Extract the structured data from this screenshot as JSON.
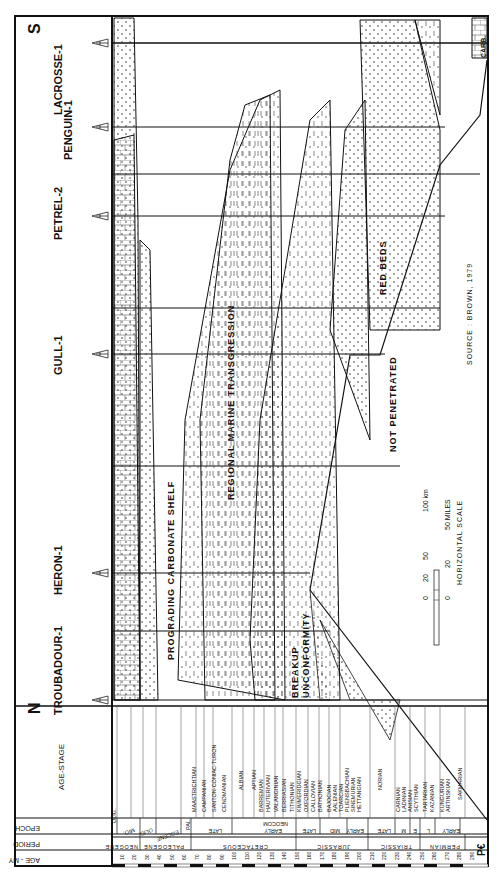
{
  "diagram": {
    "orientation": "rotated 90 degrees counter-clockwise",
    "direction_labels": {
      "north": "N",
      "south": "S"
    },
    "wells": [
      {
        "name": "TROUBADOUR-1",
        "x": 112
      },
      {
        "name": "HERON-1",
        "x": 174
      },
      {
        "name": "GULL-1",
        "x": 308
      },
      {
        "name": "PETREL-2",
        "x": 466
      },
      {
        "name": "PENGUIN-1",
        "x": 631
      },
      {
        "name": "LACROSSE-1",
        "x": 837
      }
    ],
    "annotations": {
      "prograding": "PROGRADING CARBONATE SHELF",
      "transgression": "REGIONAL MARINE TRANSGRESSION",
      "breakup": "BREAKUP",
      "unconformity": "UNCONFORMITY",
      "not_penetrated": "NOT PENETRATED",
      "red_beds": "RED BEDS",
      "carb": "CARB.",
      "pe": "P€",
      "source": "SOURCE : BROWN, 1979"
    },
    "scale": {
      "title": "HORIZONTAL SCALE",
      "km_ticks": [
        "0",
        "20",
        "50",
        "100 km"
      ],
      "mile_ticks": [
        "0",
        "20",
        "50 MILES"
      ]
    },
    "legend_headers": {
      "age_stage": "AGE-STAGE",
      "epoch": "EPOCH",
      "period": "PERIOD",
      "age_my": "AGE - MY"
    },
    "age_ticks": [
      "10",
      "20",
      "30",
      "40",
      "50",
      "60",
      "70",
      "80",
      "90",
      "100",
      "110",
      "120",
      "130",
      "140",
      "150",
      "160",
      "170",
      "180",
      "190",
      "200",
      "210",
      "220",
      "230",
      "240",
      "250",
      "260",
      "270",
      "280",
      "290"
    ],
    "periods": [
      "NEOGENE",
      "PALEOGENE",
      "CRETACEOUS",
      "JURASSIC",
      "TRIASSIC",
      "PERMIAN"
    ],
    "epochs": [
      "OLIG.",
      "MIO.",
      "OLIG.",
      "EOCENE",
      "PAL.",
      "LATE",
      "EARLY",
      "NEOCOM",
      "LATE",
      "MID",
      "EARLY",
      "LATE",
      "M",
      "E",
      "L",
      "EARLY"
    ],
    "stages": [
      "MAASTRICHTIAN",
      "CAMPANIAN",
      "SANTON-CONIAC-TURON",
      "CENOMANIAN",
      "ALBIAN",
      "APTIAN",
      "BARREMIAN",
      "HAUTERIVIAN",
      "VALANGINIAN",
      "BERRIASIAN",
      "TITHONIAN",
      "KIMMERIDGIAN",
      "OXFORDIAN",
      "CALLOVIAN",
      "BATHONIAN",
      "BAJOCIAN",
      "AALENIAN",
      "TOARCIAN",
      "PLIENSBACHIAN",
      "SINEMURIAN",
      "HETTANGIAN",
      "NORIAN",
      "CARNIAN",
      "LADINIAN",
      "ANISIAN",
      "SCYTHIAN",
      "TARTARIAN",
      "KAZANIAN",
      "KUNGURIAN",
      "ARTINSKIAN",
      "SAKMARIAN"
    ]
  }
}
